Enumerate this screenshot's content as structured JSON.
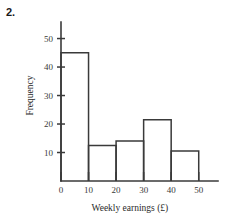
{
  "question_label": "2.",
  "chart_data": {
    "type": "bar",
    "title": "",
    "subtitle": "",
    "xlabel": "Weekly earnings (£)",
    "ylabel": "Frequency",
    "categories": [
      "0-10",
      "10-20",
      "20-30",
      "30-40",
      "40-50"
    ],
    "bin_edges": [
      0,
      10,
      20,
      30,
      40,
      50
    ],
    "values": [
      45,
      12.5,
      14,
      21.5,
      10.5
    ],
    "xlim": [
      0,
      57
    ],
    "ylim": [
      0,
      53
    ],
    "xticks": [
      0,
      10,
      20,
      30,
      40,
      50
    ],
    "xtick_labels": [
      "0",
      "10",
      "20",
      "30",
      "40",
      "50"
    ],
    "yticks": [
      10,
      20,
      30,
      40,
      50
    ],
    "ytick_labels": [
      "10",
      "20",
      "30",
      "40",
      "50"
    ],
    "grid": false,
    "legend": false,
    "legend_position": "none",
    "bar_fill": "none",
    "bar_edge_color": "#3a3a3a",
    "axis_color": "#3a3a3a",
    "background_color": "#ffffff"
  }
}
